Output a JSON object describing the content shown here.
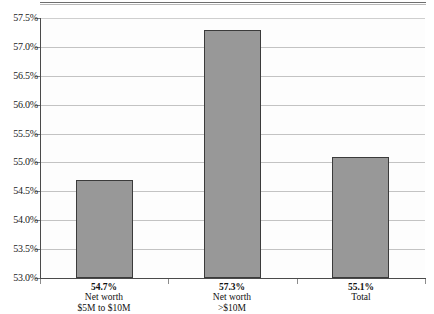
{
  "chart_data": {
    "type": "bar",
    "title": "",
    "xlabel": "",
    "ylabel": "",
    "categories": [
      "Net worth $5M to $10M",
      "Net worth >$10M",
      "Total"
    ],
    "category_lines": [
      [
        "Net worth",
        "$5M to $10M"
      ],
      [
        "Net worth",
        ">$10M"
      ],
      [
        "Total"
      ]
    ],
    "values": [
      54.7,
      57.3,
      55.1
    ],
    "value_labels": [
      "54.7%",
      "57.3%",
      "55.1%"
    ],
    "ylim": [
      53.0,
      57.5
    ],
    "ytick_step": 0.5,
    "ytick_labels": [
      "57.5%",
      "57.0%",
      "56.5%",
      "56.0%",
      "55.5%",
      "55.0%",
      "54.5%",
      "54.0%",
      "53.5%",
      "53.0%"
    ],
    "ytick_values": [
      57.5,
      57.0,
      56.5,
      56.0,
      55.5,
      55.0,
      54.5,
      54.0,
      53.5,
      53.0
    ],
    "grid": true,
    "legend": false,
    "colors": {
      "bar_fill": "#989898",
      "bar_border": "#3b3b3b",
      "gridline": "#c3c3c3",
      "axis": "#4a4a4a",
      "plot_background": "#fdfdfd",
      "text": "#111111"
    }
  }
}
